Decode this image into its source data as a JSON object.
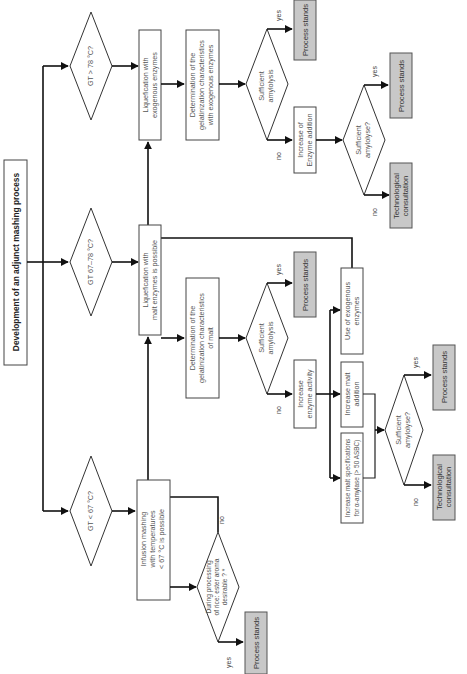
{
  "title": "Development of an adjunct mashing process",
  "branches": {
    "high": {
      "question": "GT > 78 °C?",
      "step1": [
        "Liquefication  with",
        "exogenous enzymes"
      ],
      "step2": [
        "Determination of the",
        "gelatinization characteristics",
        "with exogenous enzymes"
      ],
      "decision": [
        "Sufficient",
        "amylolysis"
      ],
      "yes_label": "yes",
      "no_label": "no",
      "yes_result": "Process stands",
      "no_action": [
        "Increase of",
        "Enzyme addition"
      ],
      "decision2": [
        "Sufficient",
        "amylolyse?"
      ],
      "decision2_yes_label": "yes",
      "decision2_no_label": "no",
      "decision2_yes_result": "Process stands",
      "decision2_no_result": [
        "Technological",
        "consultation"
      ]
    },
    "mid": {
      "question": "GT 67–78 °C?",
      "step1": [
        "Liquefication with",
        "malt enzymes is possible"
      ],
      "step2": [
        "Determination of the",
        "gelatinization characteristics",
        "of malt"
      ],
      "decision": [
        "Sufficient",
        "amylolysis"
      ],
      "yes_label": "yes",
      "no_label": "no",
      "yes_result": "Process stands",
      "no_action": [
        "Increase",
        "enzyme activity"
      ],
      "options": [
        [
          "Increase malt specifications",
          "for  α-amylase  (> 50 ASBC)"
        ],
        [
          "Increase malt",
          "addition"
        ],
        [
          "Use of exogenous",
          "enzymes"
        ]
      ],
      "decision2": [
        "Sufficient",
        "amylolyse?"
      ],
      "decision2_yes_label": "yes",
      "decision2_no_label": "no",
      "decision2_yes_result": "Process stands",
      "decision2_no_result": [
        "Technological",
        "consultation"
      ]
    },
    "low": {
      "question": "GT < 67 °C?",
      "step1": [
        "Infusion mashing",
        "with temperatures",
        "< 67 °C is possible"
      ],
      "decision": [
        "During processing",
        "of rice: ester aroma",
        "desirable ? *"
      ],
      "yes_label": "yes",
      "no_label": "no",
      "yes_result": "Process stands"
    }
  }
}
